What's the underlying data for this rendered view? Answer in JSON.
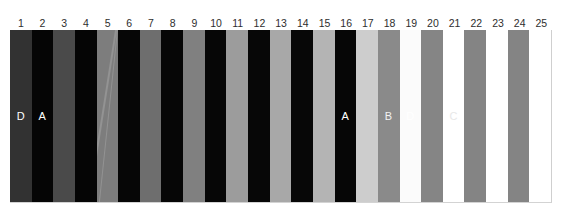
{
  "chart_data": {
    "type": "bar",
    "title": "",
    "subtitle": "",
    "xlabel": "",
    "ylabel": "",
    "grid": false,
    "legend": null,
    "orientation": "vertical",
    "categories": [
      "1",
      "2",
      "3",
      "4",
      "5",
      "6",
      "7",
      "8",
      "9",
      "10",
      "11",
      "12",
      "13",
      "14",
      "15",
      "16",
      "17",
      "18",
      "19",
      "20",
      "21",
      "22",
      "23",
      "24",
      "25"
    ],
    "values": [
      1,
      1,
      1,
      1,
      1,
      1,
      1,
      1,
      1,
      1,
      1,
      1,
      1,
      1,
      1,
      1,
      1,
      1,
      1,
      1,
      1,
      1,
      1,
      1,
      1
    ],
    "ylim": [
      0,
      1
    ],
    "bars": [
      {
        "index": 1,
        "label": "1",
        "color": "#323232",
        "letter": "D",
        "letter_color": "#ffffff"
      },
      {
        "index": 2,
        "label": "2",
        "color": "#050505",
        "letter": "A",
        "letter_color": "#ffffff"
      },
      {
        "index": 3,
        "label": "3",
        "color": "#4a4a4a",
        "letter": "",
        "letter_color": "#ffffff"
      },
      {
        "index": 4,
        "label": "4",
        "color": "#050505",
        "letter": "",
        "letter_color": "#ffffff"
      },
      {
        "index": 5,
        "label": "5",
        "color": "#7d7d7d",
        "letter": "",
        "letter_color": "#ffffff"
      },
      {
        "index": 6,
        "label": "6",
        "color": "#060606",
        "letter": "",
        "letter_color": "#ffffff"
      },
      {
        "index": 7,
        "label": "7",
        "color": "#6e6e6e",
        "letter": "",
        "letter_color": "#ffffff"
      },
      {
        "index": 8,
        "label": "8",
        "color": "#060606",
        "letter": "",
        "letter_color": "#ffffff"
      },
      {
        "index": 9,
        "label": "9",
        "color": "#808080",
        "letter": "",
        "letter_color": "#ffffff"
      },
      {
        "index": 10,
        "label": "10",
        "color": "#060606",
        "letter": "",
        "letter_color": "#ffffff"
      },
      {
        "index": 11,
        "label": "11",
        "color": "#9c9c9c",
        "letter": "",
        "letter_color": "#ffffff"
      },
      {
        "index": 12,
        "label": "12",
        "color": "#070707",
        "letter": "",
        "letter_color": "#ffffff"
      },
      {
        "index": 13,
        "label": "13",
        "color": "#a8a8a8",
        "letter": "",
        "letter_color": "#ffffff"
      },
      {
        "index": 14,
        "label": "14",
        "color": "#070707",
        "letter": "",
        "letter_color": "#ffffff"
      },
      {
        "index": 15,
        "label": "15",
        "color": "#b4b4b4",
        "letter": "",
        "letter_color": "#ffffff"
      },
      {
        "index": 16,
        "label": "16",
        "color": "#060606",
        "letter": "A",
        "letter_color": "#ffffff"
      },
      {
        "index": 17,
        "label": "17",
        "color": "#cdcdcd",
        "letter": "",
        "letter_color": "#ffffff"
      },
      {
        "index": 18,
        "label": "18",
        "color": "#8a8a8a",
        "letter": "B",
        "letter_color": "#f2f2f2"
      },
      {
        "index": 19,
        "label": "19",
        "color": "#fbfbfb",
        "letter": "D",
        "letter_color": "#ffffff"
      },
      {
        "index": 20,
        "label": "20",
        "color": "#858585",
        "letter": "",
        "letter_color": "#ffffff"
      },
      {
        "index": 21,
        "label": "21",
        "color": "#ffffff",
        "letter": "C",
        "letter_color": "#e8e8e8"
      },
      {
        "index": 22,
        "label": "22",
        "color": "#848484",
        "letter": "",
        "letter_color": "#ffffff"
      },
      {
        "index": 23,
        "label": "23",
        "color": "#ffffff",
        "letter": "",
        "letter_color": "#ffffff"
      },
      {
        "index": 24,
        "label": "24",
        "color": "#848484",
        "letter": "",
        "letter_color": "#ffffff"
      },
      {
        "index": 25,
        "label": "25",
        "color": "#ffffff",
        "letter": "",
        "letter_color": "#ffffff"
      }
    ],
    "annotations": [
      {
        "letter": "D",
        "bar": 1
      },
      {
        "letter": "A",
        "bar": 2
      },
      {
        "letter": "A",
        "bar": 16
      },
      {
        "letter": "B",
        "bar": 18
      },
      {
        "letter": "D",
        "bar": 19
      },
      {
        "letter": "C",
        "bar": 21
      }
    ]
  }
}
